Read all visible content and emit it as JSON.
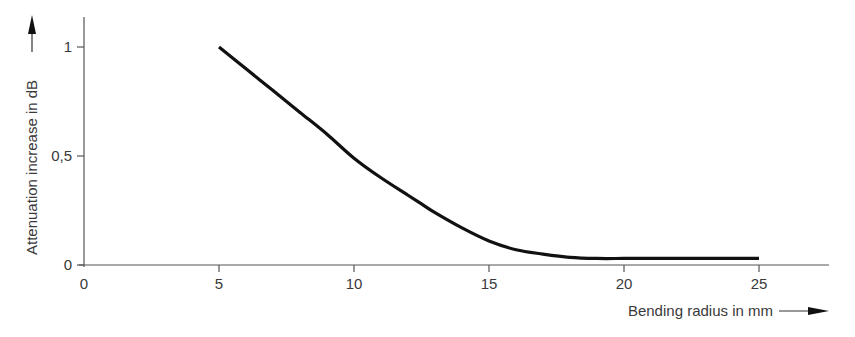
{
  "chart_data": {
    "type": "line",
    "title": "",
    "xlabel": "Bending radius in mm",
    "ylabel": "Attenuation increase in dB",
    "xlim": [
      0,
      27
    ],
    "ylim": [
      0,
      1.1
    ],
    "x_ticks": [
      0,
      5,
      10,
      15,
      20,
      25
    ],
    "x_tick_labels": [
      "0",
      "5",
      "10",
      "15",
      "20",
      "25"
    ],
    "y_ticks": [
      0,
      0.5,
      1
    ],
    "y_tick_labels": [
      "0",
      "0,5",
      "1"
    ],
    "grid": false,
    "legend": null,
    "series": [
      {
        "name": "Attenuation increase",
        "x": [
          5,
          6,
          7,
          8,
          9,
          10,
          11,
          12,
          12.5,
          13,
          14,
          15,
          16,
          17,
          18,
          19,
          20,
          21,
          22,
          23,
          24,
          25
        ],
        "values": [
          1.0,
          0.9,
          0.8,
          0.7,
          0.6,
          0.49,
          0.4,
          0.32,
          0.28,
          0.24,
          0.17,
          0.11,
          0.07,
          0.05,
          0.035,
          0.03,
          0.03,
          0.03,
          0.03,
          0.03,
          0.03,
          0.03
        ]
      }
    ]
  },
  "colors": {
    "line": "#111111",
    "axis": "#555555",
    "text": "#3a3a3a"
  }
}
